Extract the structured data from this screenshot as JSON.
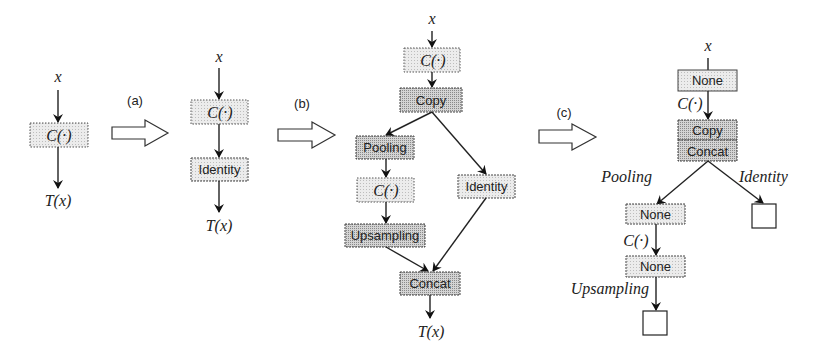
{
  "diagram": {
    "steps": [
      "(a)",
      "(b)",
      "(c)"
    ],
    "panel1": {
      "input": "x",
      "node": "C(·)",
      "output": "T(x)"
    },
    "panel2": {
      "input": "x",
      "nodes": [
        "C(·)",
        "Identity"
      ],
      "output": "T(x)"
    },
    "panel3": {
      "input": "x",
      "nodes": {
        "c_top": "C(·)",
        "copy": "Copy",
        "pooling": "Pooling",
        "c_mid": "C(·)",
        "upsampling": "Upsampling",
        "identity": "Identity",
        "concat": "Concat"
      },
      "output": "T(x)"
    },
    "panel4": {
      "input": "x",
      "nodes": {
        "none_top": "None",
        "copy": "Copy",
        "concat": "Concat",
        "none_mid": "None",
        "none_bottom": "None"
      },
      "edge_labels": {
        "c_top": "C(·)",
        "pooling": "Pooling",
        "identity": "Identity",
        "c_mid": "C(·)",
        "upsampling": "Upsampling"
      }
    }
  },
  "colors": {
    "light_fill": "#e6e6e6",
    "dark_fill": "#c8c8c8",
    "stroke": "#222222"
  }
}
